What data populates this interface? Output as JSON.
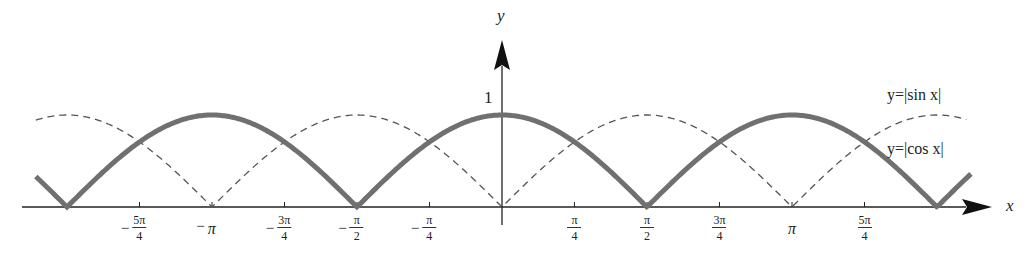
{
  "chart_data": {
    "type": "line",
    "title": "",
    "xlabel": "x",
    "ylabel": "y",
    "xlim": [
      -4.93,
      5.3
    ],
    "ylim": [
      0,
      1.4
    ],
    "grid": false,
    "legend_position": "inline-right",
    "y_ticks": [
      {
        "value": 1,
        "label": "1"
      }
    ],
    "x_ticks": [
      {
        "value": -3.927,
        "neg": true,
        "num": "5π",
        "den": "4",
        "label": "-5π/4"
      },
      {
        "value": -3.1416,
        "neg": true,
        "num": "π",
        "den": "",
        "label": "-π"
      },
      {
        "value": -2.356,
        "neg": true,
        "num": "3π",
        "den": "4",
        "label": "-3π/4"
      },
      {
        "value": -1.5708,
        "neg": true,
        "num": "π",
        "den": "2",
        "label": "-π/2"
      },
      {
        "value": -0.785,
        "neg": true,
        "num": "π",
        "den": "4",
        "label": "-π/4"
      },
      {
        "value": 0.785,
        "neg": false,
        "num": "π",
        "den": "4",
        "label": "π/4"
      },
      {
        "value": 1.5708,
        "neg": false,
        "num": "π",
        "den": "2",
        "label": "π/2"
      },
      {
        "value": 2.356,
        "neg": false,
        "num": "3π",
        "den": "4",
        "label": "3π/4"
      },
      {
        "value": 3.1416,
        "neg": false,
        "num": "π",
        "den": "",
        "label": "π"
      },
      {
        "value": 3.927,
        "neg": false,
        "num": "5π",
        "den": "4",
        "label": "5π/4"
      }
    ],
    "series": [
      {
        "name": "y=|cos x|",
        "function": "abs(cos(x))",
        "style": "solid-thick",
        "color": "#707070",
        "x_range": [
          -5.05,
          5.08
        ]
      },
      {
        "name": "y=|sin x|",
        "function": "abs(sin(x))",
        "style": "dashed-thin",
        "color": "#555555",
        "x_range": [
          -5.05,
          5.03
        ]
      }
    ],
    "sample_points": {
      "x": [
        -4.712,
        -3.927,
        -3.142,
        -2.356,
        -1.571,
        -0.785,
        0,
        0.785,
        1.571,
        2.356,
        3.142,
        3.927,
        4.712
      ],
      "abs_cos": [
        0,
        0.707,
        1,
        0.707,
        0,
        0.707,
        1,
        0.707,
        0,
        0.707,
        1,
        0.707,
        0
      ],
      "abs_sin": [
        1,
        0.707,
        0,
        0.707,
        1,
        0.707,
        0,
        0.707,
        1,
        0.707,
        0,
        0.707,
        1
      ]
    }
  },
  "labels": {
    "x_axis": "x",
    "y_axis": "y",
    "y_one": "1",
    "legend_sin": "y=|sin x|",
    "legend_cos": "y=|cos x|",
    "minus": "−"
  },
  "colors": {
    "thick_curve": "#707070",
    "dashed_curve": "#555555",
    "axis": "#222222"
  }
}
